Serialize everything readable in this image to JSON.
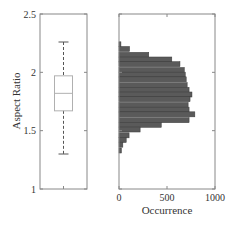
{
  "chart_data": [
    {
      "type": "box",
      "title": "",
      "xlabel": "",
      "ylabel": "Aspect Ratio",
      "ylim": [
        1,
        2.5
      ],
      "yticks": [
        1,
        1.5,
        2,
        2.5
      ],
      "ytick_labels": [
        "1",
        "1.5",
        "2",
        "2.5"
      ],
      "grid": false,
      "box": {
        "lower_whisker": 1.3,
        "q1": 1.67,
        "median": 1.82,
        "q3": 1.97,
        "upper_whisker": 2.26
      },
      "colors": {
        "box": "#b0b0b0",
        "whisker": "#555555",
        "frame": "#888888"
      }
    },
    {
      "type": "bar",
      "orientation": "horizontal",
      "title": "",
      "xlabel": "Occurrence",
      "ylabel": "",
      "xlim": [
        0,
        1000
      ],
      "xticks": [
        0,
        500,
        1000
      ],
      "xtick_labels": [
        "0",
        "500",
        "1000"
      ],
      "ylim": [
        1,
        2.5
      ],
      "grid": false,
      "bin_width": 0.043,
      "bins_center": [
        2.24,
        2.2,
        2.15,
        2.11,
        2.07,
        2.02,
        1.98,
        1.94,
        1.89,
        1.85,
        1.81,
        1.77,
        1.72,
        1.68,
        1.64,
        1.59,
        1.55,
        1.51,
        1.46,
        1.42,
        1.38,
        1.33
      ],
      "values": [
        20,
        110,
        310,
        550,
        635,
        680,
        690,
        700,
        710,
        730,
        760,
        740,
        720,
        730,
        790,
        730,
        440,
        220,
        105,
        75,
        40,
        25
      ],
      "colors": {
        "bar": "#5a5a5a",
        "bar_edge": "#3a3a3a",
        "frame": "#888888"
      }
    }
  ],
  "left_panel": {
    "ylabel": "Aspect Ratio",
    "yticks": [
      "2.5",
      "2",
      "1.5",
      "1"
    ]
  },
  "right_panel": {
    "xlabel": "Occurrence",
    "xticks": [
      "0",
      "500",
      "1000"
    ]
  }
}
